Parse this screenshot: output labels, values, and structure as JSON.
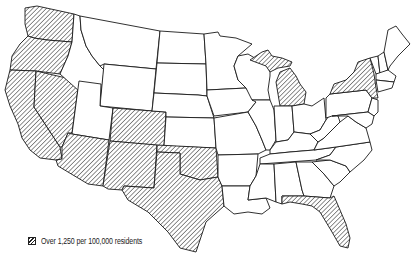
{
  "map": {
    "type": "choropleth",
    "region": "Contiguous United States",
    "legend": {
      "label": "Over 1,250 per 100,000 residents",
      "pattern": "diagonal-hatch"
    },
    "highlighted_states": [
      "Washington",
      "Oregon",
      "California",
      "Nevada",
      "Arizona",
      "New Mexico",
      "Colorado",
      "Texas",
      "Oklahoma",
      "Michigan",
      "New York",
      "Florida"
    ],
    "colors": {
      "outline": "#1a1a1a",
      "fill": "#ffffff",
      "hatch": "#222222"
    }
  }
}
